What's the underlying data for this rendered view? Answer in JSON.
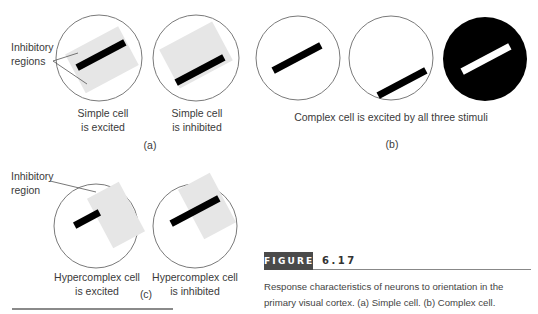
{
  "figure": {
    "label": "FIGURE",
    "number": "6.17",
    "caption_lines": [
      "Response characteristics of neurons to orientation in the",
      "primary visual cortex. (a) Simple cell. (b) Complex cell."
    ]
  },
  "panels": {
    "a": {
      "tag": "(a)",
      "annotation_lines": [
        "Inhibitory",
        "regions"
      ],
      "cells": [
        {
          "caption_lines": [
            "Simple cell",
            "is excited"
          ]
        },
        {
          "caption_lines": [
            "Simple cell",
            "is inhibited"
          ]
        }
      ]
    },
    "b": {
      "tag": "(b)",
      "caption": "Complex cell is excited by all three stimuli"
    },
    "c": {
      "tag": "(c)",
      "annotation_lines": [
        "Inhibitory",
        "region"
      ],
      "cells": [
        {
          "caption_lines": [
            "Hypercomplex cell",
            "is excited"
          ]
        },
        {
          "caption_lines": [
            "Hypercomplex cell",
            "is inhibited"
          ]
        }
      ]
    }
  },
  "colors": {
    "circle_stroke": "#7a7a7a",
    "inhibitory_fill": "#e6e6e6",
    "bar": "#000000",
    "label_bg": "#4a4a4a"
  }
}
